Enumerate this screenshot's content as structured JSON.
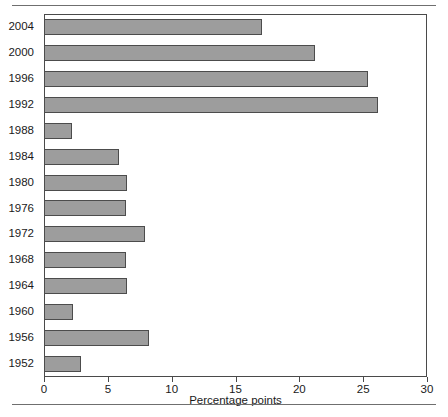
{
  "chart_data": {
    "type": "bar",
    "orientation": "horizontal",
    "title": "",
    "subtitle": "",
    "xlabel": "Percentage points",
    "ylabel": "",
    "xlim": [
      0,
      30
    ],
    "xticks": [
      0,
      5,
      10,
      15,
      20,
      25,
      30
    ],
    "xtick_labels": [
      "0",
      "5",
      "10",
      "15",
      "20",
      "25",
      "30"
    ],
    "grid": false,
    "legend": null,
    "categories": [
      "2004",
      "2000",
      "1996",
      "1992",
      "1988",
      "1984",
      "1980",
      "1976",
      "1972",
      "1968",
      "1964",
      "1960",
      "1956",
      "1952"
    ],
    "values": [
      17.1,
      21.2,
      25.4,
      26.2,
      2.2,
      5.9,
      6.5,
      6.4,
      7.9,
      6.4,
      6.5,
      2.3,
      8.2,
      2.9
    ],
    "series": [
      {
        "name": "Percentage points",
        "values": [
          17.1,
          21.2,
          25.4,
          26.2,
          2.2,
          5.9,
          6.5,
          6.4,
          7.9,
          6.4,
          6.5,
          2.3,
          8.2,
          2.9
        ]
      }
    ],
    "bar_color": "#9d9d9d",
    "bar_border_color": "#4c4c4c",
    "axis_color": "#4a4a4a"
  }
}
